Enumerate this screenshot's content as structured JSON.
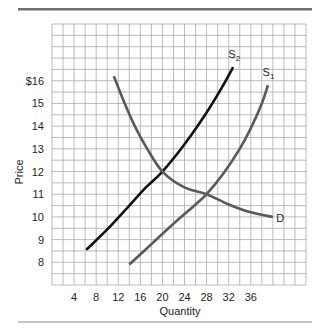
{
  "colors": {
    "top_rule": "#6d6e70",
    "bottom_rule": "#8a8a8a",
    "grid": "#a9a9a9",
    "text": "#231f20"
  },
  "chart_data": {
    "type": "line",
    "title": "",
    "xlabel": "Quantity",
    "ylabel": "Price",
    "xlim": [
      0,
      46
    ],
    "ylim": [
      7,
      18.5
    ],
    "x_ticks": [
      4,
      8,
      12,
      16,
      20,
      24,
      28,
      32,
      36
    ],
    "x_tick_labels": [
      "4",
      "8",
      "12",
      "16",
      "20",
      "24",
      "28",
      "32",
      "36"
    ],
    "y_ticks": [
      8,
      9,
      10,
      11,
      12,
      13,
      14,
      15,
      16
    ],
    "y_tick_labels": [
      "8",
      "9",
      "10",
      "11",
      "12",
      "13",
      "14",
      "15",
      "$16"
    ],
    "grid": true,
    "grid_step_x": 2,
    "grid_step_y": 0.5,
    "legend": "none (curves labeled inline)",
    "series": [
      {
        "name": "S2",
        "label": "S",
        "label_sub": "2",
        "color": "#111111",
        "width": 2.6,
        "points": [
          [
            6.2,
            8.55
          ],
          [
            10,
            9.45
          ],
          [
            14,
            10.5
          ],
          [
            17,
            11.3
          ],
          [
            20,
            12.0
          ],
          [
            24,
            13.2
          ],
          [
            28,
            14.6
          ],
          [
            31,
            15.8
          ],
          [
            32.8,
            16.6
          ]
        ],
        "label_pos": [
          33,
          17.2
        ]
      },
      {
        "name": "S1",
        "label": "S",
        "label_sub": "1",
        "color": "#58595b",
        "width": 2.6,
        "points": [
          [
            14,
            7.9
          ],
          [
            18,
            8.8
          ],
          [
            22,
            9.7
          ],
          [
            26,
            10.55
          ],
          [
            28,
            11.0
          ],
          [
            31,
            11.9
          ],
          [
            34,
            13.0
          ],
          [
            36,
            13.9
          ],
          [
            38,
            15.0
          ],
          [
            39.1,
            15.8
          ]
        ],
        "label_pos": [
          39.2,
          16.4
        ]
      },
      {
        "name": "D",
        "label": "D",
        "label_sub": "",
        "color": "#58595b",
        "width": 2.6,
        "points": [
          [
            11.2,
            16.2
          ],
          [
            13,
            15.1
          ],
          [
            15,
            14.0
          ],
          [
            17,
            13.1
          ],
          [
            20,
            12.0
          ],
          [
            24,
            11.3
          ],
          [
            28,
            11.0
          ],
          [
            32,
            10.55
          ],
          [
            36,
            10.2
          ],
          [
            40,
            10.0
          ]
        ],
        "label_pos": [
          40.6,
          9.95
        ]
      }
    ],
    "annotations": [
      {
        "text": "Equilibrium of D and S2 at Q=20, P=12",
        "implicit": true
      },
      {
        "text": "Equilibrium of D and S1 at Q=28, P=11",
        "implicit": true
      }
    ]
  }
}
